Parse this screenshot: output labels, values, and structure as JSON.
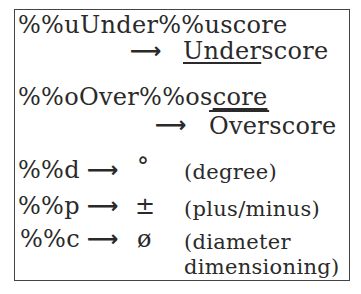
{
  "rows": {
    "under": {
      "code": "%%uUnder%%uscore",
      "arrow": "⟶",
      "result_marked": "Under",
      "result_rest": "score"
    },
    "over": {
      "code_plain": "%%oOver%%os",
      "code_marked": "core",
      "arrow": "⟶",
      "result_marked": "Over",
      "result_rest": "score"
    },
    "degree": {
      "code": "%%d",
      "arrow": "⟶",
      "symbol": "°",
      "desc": "(degree)"
    },
    "plusminus": {
      "code": "%%p",
      "arrow": "⟶",
      "symbol": "±",
      "desc": "(plus/minus)"
    },
    "diameter": {
      "code": "%%c",
      "arrow": "⟶",
      "symbol": "ø",
      "desc_line1": "(diameter",
      "desc_line2": "dimensioning)"
    }
  }
}
